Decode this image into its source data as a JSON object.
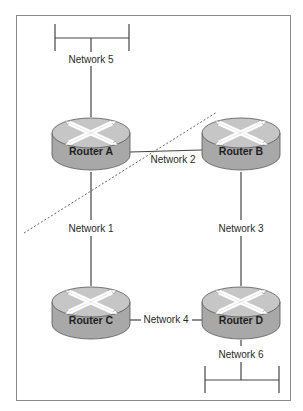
{
  "diagram": {
    "type": "network-topology",
    "colors": {
      "frame": "#888888",
      "line": "#444444",
      "router_body": "#a9a9a9",
      "router_top": "#c4c4c4",
      "arrow": "#ffffff",
      "dashed_line": "#666666"
    },
    "routers": [
      {
        "id": "A",
        "label": "Router A"
      },
      {
        "id": "B",
        "label": "Router B"
      },
      {
        "id": "C",
        "label": "Router C"
      },
      {
        "id": "D",
        "label": "Router D"
      }
    ],
    "networks": [
      {
        "id": "1",
        "label": "Network 1",
        "connects": [
          "Router A",
          "Router C"
        ]
      },
      {
        "id": "2",
        "label": "Network 2",
        "connects": [
          "Router A",
          "Router B"
        ]
      },
      {
        "id": "3",
        "label": "Network 3",
        "connects": [
          "Router B",
          "Router D"
        ]
      },
      {
        "id": "4",
        "label": "Network 4",
        "connects": [
          "Router C",
          "Router D"
        ]
      },
      {
        "id": "5",
        "label": "Network 5",
        "connects": [
          "Router A",
          "LAN segment"
        ]
      },
      {
        "id": "6",
        "label": "Network 6",
        "connects": [
          "Router D",
          "LAN segment"
        ]
      }
    ],
    "annotations": [
      {
        "type": "dashed-line",
        "description": "Diagonal dashed boundary crossing Network 1 and Network 2"
      }
    ]
  }
}
